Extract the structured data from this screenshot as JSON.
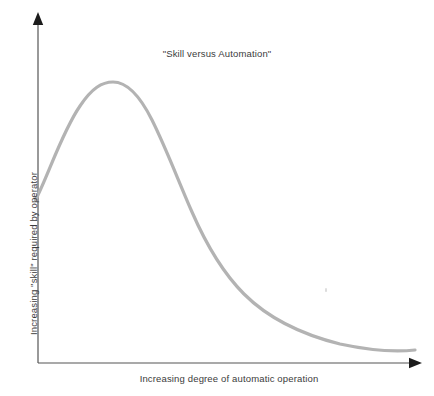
{
  "figure": {
    "width": 434,
    "height": 396,
    "background": "#ffffff"
  },
  "chart_data": {
    "type": "line",
    "title": "\"Skill versus Automation\"",
    "subtitle": "",
    "xlabel": "Increasing degree of automatic operation",
    "ylabel": "Increasing \"skill\" required by operator",
    "grid": false,
    "legend": null,
    "legend_position": "none",
    "axis_ticks": false,
    "tick_labels": {
      "x": [],
      "y": []
    },
    "xlim": [
      0,
      100
    ],
    "ylim": [
      0,
      100
    ],
    "line_color": "#b3b3b3",
    "line_width": 3.2,
    "axis_color": "#555555",
    "text_color": "#3b3b3b",
    "annotations": [],
    "series": [
      {
        "name": "Skill required by operator",
        "color": "#b3b3b3",
        "x": [
          0,
          5,
          10,
          15,
          20,
          25,
          30,
          35,
          40,
          45,
          50,
          55,
          60,
          65,
          70,
          75,
          80,
          85,
          90,
          95,
          100
        ],
        "y": [
          47,
          63,
          75,
          83,
          87,
          86,
          82,
          74,
          64,
          54,
          45,
          38,
          32,
          27,
          23,
          20,
          17,
          14,
          12,
          10,
          9
        ]
      }
    ],
    "axis_arrows": {
      "x": "right",
      "y": "up"
    }
  },
  "geometry": {
    "origin_x": 38,
    "origin_y": 363,
    "x_axis_end": 420,
    "y_axis_top": 14,
    "curve_path": "M 35.5,200 C 48,176 62,132 80,106 C 92,88 102,82 113,82 C 126,82 139,94 152,120 C 166,148 178,180 192,212 C 206,244 222,272 244,294 C 268,318 300,334 340,344 C 368,350 396,352 415,350"
  }
}
